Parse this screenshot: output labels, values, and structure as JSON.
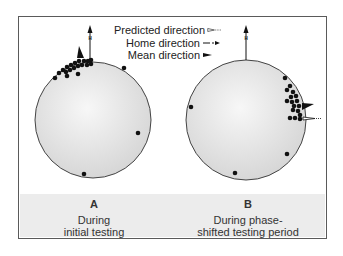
{
  "legend": {
    "predicted": "Predicted direction",
    "home": "Home direction",
    "mean": "Mean direction"
  },
  "panels": [
    {
      "letter": "A",
      "caption_line1": "During",
      "caption_line2": "initial testing",
      "home_marker": "H"
    },
    {
      "letter": "B",
      "caption_line1": "During phase-",
      "caption_line2": "shifted testing period",
      "home_marker": "H"
    }
  ],
  "colors": {
    "frame": "#5a5a5a",
    "circle_fill_light": "#f2f2f2",
    "circle_fill_dark": "#d6d6d6",
    "dot": "#111111",
    "caption_band": "#ececec"
  },
  "icons": {
    "predicted": "open-triangle-dotted-arrow-icon",
    "home": "dashed-arrow-icon",
    "mean": "solid-triangle-icon"
  }
}
